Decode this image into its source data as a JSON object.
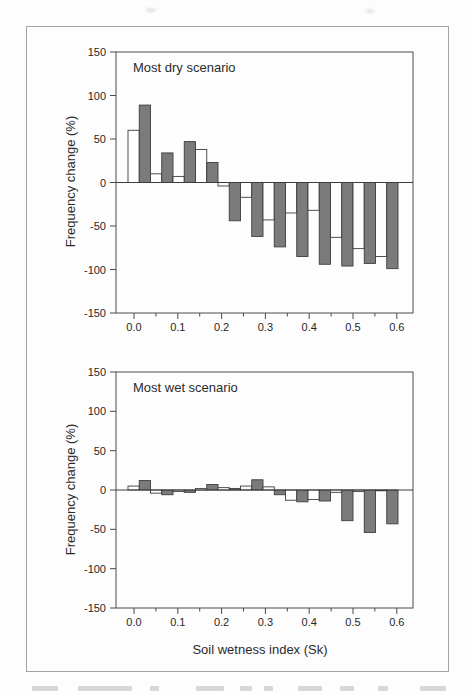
{
  "figure": {
    "styles": {
      "grey_bar_fill": "#7b7b7b",
      "white_bar_fill": "#fefefe",
      "bar_outline": "#3d3d3d",
      "axis_color": "#4c4c4c",
      "frame_color": "#a3a3a3",
      "text_color": "#272727",
      "background": "#fdfdfd"
    }
  },
  "chart_data": [
    {
      "type": "bar",
      "title": "Most dry scenario",
      "ylabel": "Frequency change (%)",
      "xlabel": "",
      "ylim": [
        -150,
        150
      ],
      "ytick_values": [
        150,
        100,
        50,
        0,
        -50,
        -100,
        -150
      ],
      "ytick_labels": [
        "150",
        "100",
        "50",
        "0",
        "-50",
        "-100",
        "-150"
      ],
      "xtick_values": [
        0.0,
        0.1,
        0.2,
        0.3,
        0.4,
        0.5,
        0.6
      ],
      "xtick_labels": [
        "0.0",
        "0.1",
        "0.2",
        "0.3",
        "0.4",
        "0.5",
        "0.6"
      ],
      "minor_xtick_step": 0.05,
      "grid": false,
      "legend": "none",
      "zero_line": true,
      "bins": {
        "start": 0.0,
        "end": 0.6,
        "count": 12,
        "width": 0.05
      },
      "series": [
        {
          "name": "white_bars",
          "fill": "#fefefe",
          "values": [
            60,
            10,
            7,
            38,
            -4,
            -17,
            -43,
            -35,
            -32,
            -63,
            -76,
            -85
          ]
        },
        {
          "name": "grey_bars",
          "fill": "#7b7b7b",
          "values": [
            89,
            34,
            47,
            23,
            -44,
            -62,
            -74,
            -85,
            -94,
            -96,
            -93,
            -99
          ]
        }
      ]
    },
    {
      "type": "bar",
      "title": "Most wet scenario",
      "ylabel": "Frequency change (%)",
      "xlabel": "Soil wetness index (Sk)",
      "ylim": [
        -150,
        150
      ],
      "ytick_values": [
        150,
        100,
        50,
        0,
        -50,
        -100,
        -150
      ],
      "ytick_labels": [
        "150",
        "100",
        "50",
        "0",
        "-50",
        "-100",
        "-150"
      ],
      "xtick_values": [
        0.0,
        0.1,
        0.2,
        0.3,
        0.4,
        0.5,
        0.6
      ],
      "xtick_labels": [
        "0.0",
        "0.1",
        "0.2",
        "0.3",
        "0.4",
        "0.5",
        "0.6"
      ],
      "minor_xtick_step": 0.05,
      "grid": false,
      "legend": "none",
      "zero_line": true,
      "bins": {
        "start": 0.0,
        "end": 0.6,
        "count": 12,
        "width": 0.05
      },
      "series": [
        {
          "name": "white_bars",
          "fill": "#fefefe",
          "values": [
            5,
            -4,
            -2,
            2,
            3,
            5,
            4,
            -13,
            -12,
            -3,
            -2,
            -1
          ]
        },
        {
          "name": "grey_bars",
          "fill": "#7b7b7b",
          "values": [
            12,
            -6,
            -3,
            7,
            2,
            13,
            -6,
            -15,
            -14,
            -39,
            -54,
            -43
          ]
        }
      ]
    }
  ]
}
